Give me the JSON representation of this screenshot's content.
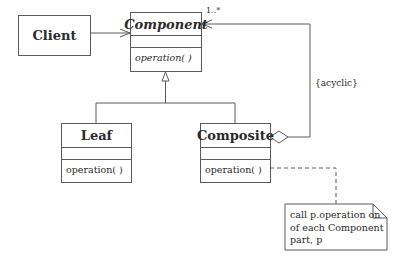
{
  "diagram": {
    "type": "UML class diagram",
    "classes": {
      "client": {
        "name": "Client"
      },
      "component": {
        "name": "Component",
        "abstract": true,
        "operation": "operation( )"
      },
      "leaf": {
        "name": "Leaf",
        "operation": "operation( )"
      },
      "composite": {
        "name": "Composite",
        "operation": "operation( )"
      }
    },
    "labels": {
      "multiplicity": "1..*",
      "constraint": "{acyclic}"
    },
    "note": {
      "lines": [
        "call p.operation on",
        "of each Component",
        "part, p"
      ]
    },
    "relationships": [
      {
        "from": "Client",
        "to": "Component",
        "kind": "association (navigable)"
      },
      {
        "from": "Leaf",
        "to": "Component",
        "kind": "generalization"
      },
      {
        "from": "Composite",
        "to": "Component",
        "kind": "generalization"
      },
      {
        "from": "Composite",
        "to": "Component",
        "kind": "aggregation",
        "multiplicity": "1..*",
        "constraint": "{acyclic}"
      },
      {
        "from": "Composite.operation",
        "to": "note",
        "kind": "note anchor (dashed)"
      }
    ],
    "colors": {
      "line": "#5a5a5a",
      "text": "#2a2a2a",
      "background": "#ffffff"
    }
  }
}
